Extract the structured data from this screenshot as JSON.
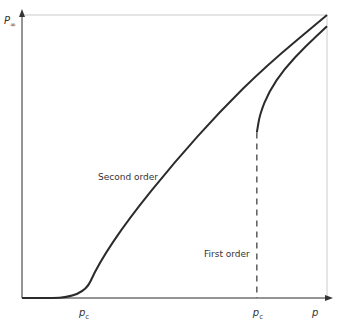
{
  "chart_data": {
    "type": "line",
    "title": "",
    "xlabel": "p",
    "ylabel": "P∞",
    "ylabel_main": "P",
    "ylabel_sub": "∞",
    "xlim": [
      0,
      1
    ],
    "ylim": [
      0,
      1
    ],
    "grid": false,
    "tick_labels": [
      {
        "main": "p",
        "sub": "c",
        "x": 0.2
      },
      {
        "main": "p",
        "sub": "c",
        "x": 0.77
      }
    ],
    "series": [
      {
        "name": "Second order",
        "points": [
          [
            0,
            0
          ],
          [
            0.2,
            0
          ],
          [
            0.25,
            0.12
          ],
          [
            0.35,
            0.28
          ],
          [
            0.5,
            0.48
          ],
          [
            0.65,
            0.66
          ],
          [
            0.8,
            0.82
          ],
          [
            1.0,
            1.0
          ]
        ]
      },
      {
        "name": "First order",
        "points": [
          [
            0.77,
            0.585
          ],
          [
            0.78,
            0.65
          ],
          [
            0.81,
            0.73
          ],
          [
            0.86,
            0.81
          ],
          [
            0.93,
            0.89
          ],
          [
            1.0,
            0.96
          ]
        ],
        "jump_at": 0.77
      }
    ],
    "annotations": [
      {
        "text": "Second order",
        "near": "middle-left of second-order curve"
      },
      {
        "text": "First order",
        "near": "left of dashed jump line"
      }
    ]
  }
}
